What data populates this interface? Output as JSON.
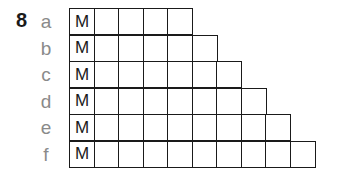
{
  "question_number": "8",
  "rows": [
    {
      "label": "a",
      "first_cell": "M",
      "cell_count": 5
    },
    {
      "label": "b",
      "first_cell": "M",
      "cell_count": 6
    },
    {
      "label": "c",
      "first_cell": "M",
      "cell_count": 7
    },
    {
      "label": "d",
      "first_cell": "M",
      "cell_count": 8
    },
    {
      "label": "e",
      "first_cell": "M",
      "cell_count": 9
    },
    {
      "label": "f",
      "first_cell": "M",
      "cell_count": 10
    }
  ]
}
